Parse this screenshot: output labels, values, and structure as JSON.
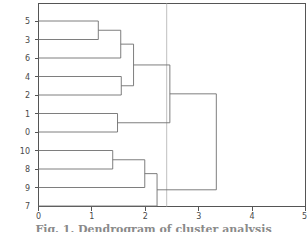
{
  "figure": {
    "caption": "Fig. 1. Dendrogram of cluster analysis",
    "background_color": "#ffffff",
    "line_color": "#6f6f6f",
    "axis_color": "#555555",
    "cutline_color": "#b9b9b9"
  },
  "chart_data": {
    "type": "dendrogram",
    "title": "",
    "xlabel": "",
    "ylabel": "",
    "orientation": "horizontal",
    "xlim": [
      0,
      5
    ],
    "ylim": [
      0,
      11
    ],
    "grid": false,
    "legend": "none",
    "x_ticks": [
      0,
      1,
      2,
      3,
      4,
      5
    ],
    "x_tick_labels": [
      "0",
      "1",
      "2",
      "3",
      "4",
      "5"
    ],
    "leaf_order": [
      "5",
      "3",
      "6",
      "4",
      "2",
      "1",
      "0",
      "10",
      "8",
      "9",
      "7"
    ],
    "y_tick_labels": [
      "5",
      "3",
      "6",
      "4",
      "2",
      "1",
      "0",
      "10",
      "8",
      "9",
      "7"
    ],
    "cut_threshold": 2.4,
    "merges": [
      {
        "id": "m1",
        "left": "5",
        "right": "3",
        "distance": 1.12
      },
      {
        "id": "m2",
        "left": "m1",
        "right": "6",
        "distance": 1.54
      },
      {
        "id": "m3",
        "left": "4",
        "right": "2",
        "distance": 1.55
      },
      {
        "id": "m4",
        "left": "m2",
        "right": "m3",
        "distance": 1.78
      },
      {
        "id": "m5",
        "left": "1",
        "right": "0",
        "distance": 1.48
      },
      {
        "id": "m6",
        "left": "m4",
        "right": "m5",
        "distance": 2.46
      },
      {
        "id": "m7",
        "left": "10",
        "right": "8",
        "distance": 1.39
      },
      {
        "id": "m8",
        "left": "m7",
        "right": "9",
        "distance": 1.99
      },
      {
        "id": "m9",
        "left": "m8",
        "right": "7",
        "distance": 2.22
      },
      {
        "id": "m10",
        "left": "m6",
        "right": "m9",
        "distance": 3.33
      }
    ]
  }
}
